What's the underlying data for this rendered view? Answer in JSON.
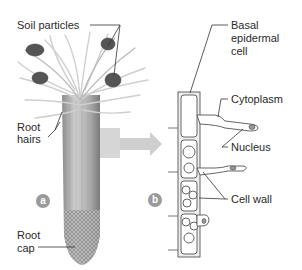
{
  "figure": {
    "panel_a": {
      "badge": "a",
      "labels": {
        "soil_particles": "Soil particles",
        "root_hairs_line1": "Root",
        "root_hairs_line2": "hairs",
        "root_cap_line1": "Root",
        "root_cap_line2": "cap"
      }
    },
    "panel_b": {
      "badge": "b",
      "labels": {
        "basal_line1": "Basal",
        "basal_line2": "epidermal",
        "basal_line3": "cell",
        "cytoplasm": "Cytoplasm",
        "nucleus": "Nucleus",
        "cell_wall": "Cell wall"
      }
    },
    "colors": {
      "badge": "#9a9a9a",
      "arrow": "#c8c8c8",
      "root": "#b5b5b5",
      "outline": "#555555"
    }
  }
}
